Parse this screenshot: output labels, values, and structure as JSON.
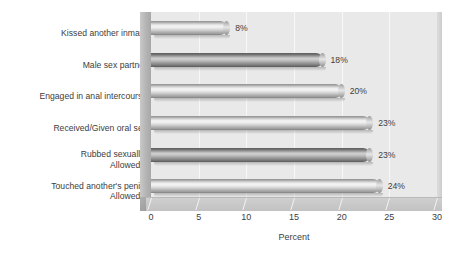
{
  "chart_data": {
    "type": "bar",
    "orientation": "horizontal",
    "title": "",
    "subtitle": "",
    "xlabel": "Percent",
    "ylabel": "",
    "xlim": [
      0,
      30
    ],
    "xticks": [
      0,
      5,
      10,
      15,
      20,
      25,
      30
    ],
    "xtick_labels": [
      "0",
      "5",
      "10",
      "15",
      "20",
      "25",
      "30"
    ],
    "grid": "vertical-only",
    "legend": "none",
    "categories": [
      "Kissed another inmate",
      "Male sex partner",
      "Engaged in anal intercourse",
      "Received/Given oral sex",
      "Rubbed sexually/\nAllowed it",
      "Touched another's penis/\nAllowed it"
    ],
    "values": [
      8,
      18,
      20,
      23,
      23,
      24
    ],
    "data_labels": [
      "8%",
      "18%",
      "20%",
      "23%",
      "23%",
      "24%"
    ],
    "bars": [
      {
        "category": "Kissed another inmate",
        "value": 8,
        "label": "8%",
        "shade": "light"
      },
      {
        "category": "Male sex partner",
        "value": 18,
        "label": "18%",
        "shade": "dark"
      },
      {
        "category": "Engaged in anal intercourse",
        "value": 20,
        "label": "20%",
        "shade": "light"
      },
      {
        "category": "Received/Given oral sex",
        "value": 23,
        "label": "23%",
        "shade": "light"
      },
      {
        "category": "Rubbed sexually/\nAllowed it",
        "value": 23,
        "label": "23%",
        "shade": "dark"
      },
      {
        "category": "Touched another's penis/\nAllowed it",
        "value": 24,
        "label": "24%",
        "shade": "light"
      }
    ],
    "colors": {
      "plot_background": "#e9e9e9",
      "page_background": "#ffffff",
      "gridline": "#f7f7f7",
      "bar_light_mid": "#f4f4f4",
      "bar_dark_mid": "#cfcfcf",
      "text": "#3d3d3d",
      "floor": "#c2c2c2"
    }
  }
}
